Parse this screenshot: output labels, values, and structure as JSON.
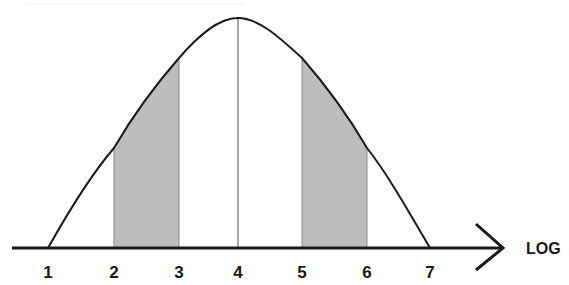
{
  "diagram": {
    "type": "bell-curve",
    "axis_label": "LOG",
    "ticks": [
      {
        "label": "1",
        "x": 48
      },
      {
        "label": "2",
        "x": 114
      },
      {
        "label": "3",
        "x": 179
      },
      {
        "label": "4",
        "x": 238
      },
      {
        "label": "5",
        "x": 302
      },
      {
        "label": "6",
        "x": 367
      },
      {
        "label": "7",
        "x": 430
      }
    ],
    "shaded_regions": [
      {
        "from": "2",
        "to": "3"
      },
      {
        "from": "5",
        "to": "6"
      }
    ],
    "center_line_at": "4",
    "colors": {
      "curve": "#1a1a1a",
      "shade": "#bdbdbd",
      "shade_edge": "#8a8a8a",
      "axis": "#1a1a1a"
    }
  }
}
